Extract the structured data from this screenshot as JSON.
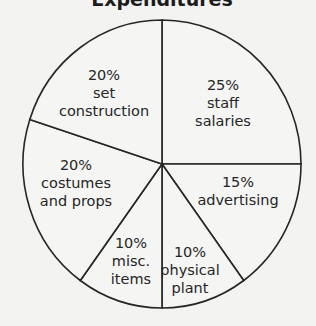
{
  "chart_data": {
    "type": "pie",
    "title": "Expenditures",
    "start_angle_deg": 0,
    "direction": "clockwise",
    "slices": [
      {
        "label": "staff salaries",
        "value": 25,
        "value_label": "25%",
        "label_lines": [
          "25%",
          "staff",
          "salaries"
        ]
      },
      {
        "label": "advertising",
        "value": 15,
        "value_label": "15%",
        "label_lines": [
          "15%",
          "advertising"
        ]
      },
      {
        "label": "physical plant",
        "value": 10,
        "value_label": "10%",
        "label_lines": [
          "10%",
          "physical",
          "plant"
        ]
      },
      {
        "label": "misc. items",
        "value": 10,
        "value_label": "10%",
        "label_lines": [
          "10%",
          "misc.",
          "items"
        ]
      },
      {
        "label": "costumes and props",
        "value": 20,
        "value_label": "20%",
        "label_lines": [
          "20%",
          "costumes",
          "and props"
        ]
      },
      {
        "label": "set construction",
        "value": 20,
        "value_label": "20%",
        "label_lines": [
          "20%",
          "set",
          "construction"
        ]
      }
    ],
    "categories": [
      "staff salaries",
      "advertising",
      "physical plant",
      "misc. items",
      "costumes and props",
      "set construction"
    ],
    "values": [
      25,
      15,
      10,
      10,
      20,
      20
    ],
    "units": "%",
    "legend": "none (labels inside slices)"
  },
  "colors": {
    "background": "#f3f3f2",
    "slice_fill": "#f5f5f4",
    "line": "#262626",
    "text": "#262626"
  }
}
